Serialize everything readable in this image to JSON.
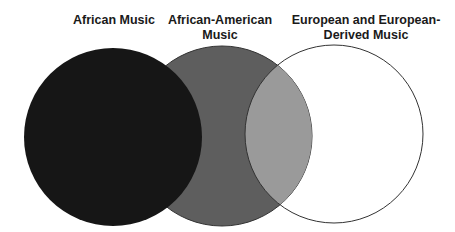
{
  "diagram": {
    "type": "venn",
    "sets": [
      {
        "name": "African Music",
        "label_lines": [
          "African Music"
        ],
        "fill": "#161616"
      },
      {
        "name": "African-American Music",
        "label_lines": [
          "African-American",
          "Music"
        ],
        "fill": "#5e5e5e"
      },
      {
        "name": "European and European-Derived Music",
        "label_lines": [
          "European and European-",
          "Derived Music"
        ],
        "fill": "#ffffff"
      }
    ],
    "overlap_fill": "#9a9a9a",
    "outline_color": "#333333"
  }
}
